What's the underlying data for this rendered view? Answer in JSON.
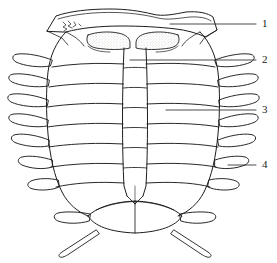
{
  "figure": {
    "kind": "scientific-line-drawing",
    "background_color": "#ffffff",
    "ink_color": "#1d1d1d",
    "stipple_color": "#b9b5ad",
    "width_px": 277,
    "height_px": 263
  },
  "callouts": [
    {
      "id": "1",
      "label": "1",
      "label_x": 262,
      "label_y": 18,
      "leader_x1": 170,
      "leader_y1": 24,
      "leader_x2": 256,
      "leader_y2": 24
    },
    {
      "id": "2",
      "label": "2",
      "label_x": 262,
      "label_y": 54,
      "leader_x1": 130,
      "leader_y1": 60,
      "leader_x2": 256,
      "leader_y2": 60
    },
    {
      "id": "3",
      "label": "3",
      "label_x": 262,
      "label_y": 104,
      "leader_x1": 166,
      "leader_y1": 110,
      "leader_x2": 256,
      "leader_y2": 110
    },
    {
      "id": "4",
      "label": "4",
      "label_x": 262,
      "label_y": 159,
      "leader_x1": 228,
      "leader_y1": 165,
      "leader_x2": 256,
      "leader_y2": 165
    }
  ],
  "anatomy": {
    "head_shield_label": "cephalon-plate",
    "eye_lobe_left_label": "eye-lobe-left",
    "eye_lobe_right_label": "eye-lobe-right",
    "axial_ridge_label": "axial-ridge",
    "thoracic_segment_count": 7,
    "pleural_spine_count_per_side": 7,
    "tail_plate_label": "pygidium",
    "caudal_ramus_count": 2
  }
}
